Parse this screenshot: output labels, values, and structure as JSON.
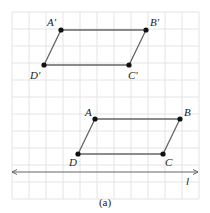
{
  "figure": {
    "caption": "(a)",
    "grid": {
      "x0": 12,
      "y0": 12,
      "cell": 17,
      "cols": 11,
      "rows": 11,
      "color": "#e4e4e4"
    },
    "line_color": "#666666",
    "point_color": "#111111",
    "line_l": {
      "label": "l",
      "y": 172,
      "x1": 12,
      "x2": 198
    },
    "parallelogram_image": {
      "points": [
        {
          "name": "A'",
          "x": 61,
          "y": 30,
          "lx": 47,
          "ly": 26
        },
        {
          "name": "B'",
          "x": 146,
          "y": 30,
          "lx": 150,
          "ly": 26
        },
        {
          "name": "C'",
          "x": 129,
          "y": 65,
          "lx": 128,
          "ly": 79
        },
        {
          "name": "D'",
          "x": 44,
          "y": 65,
          "lx": 30,
          "ly": 79
        }
      ]
    },
    "parallelogram_original": {
      "points": [
        {
          "name": "A",
          "x": 95,
          "y": 119,
          "lx": 85,
          "ly": 116
        },
        {
          "name": "B",
          "x": 180,
          "y": 119,
          "lx": 184,
          "ly": 116
        },
        {
          "name": "C",
          "x": 163,
          "y": 154,
          "lx": 165,
          "ly": 166
        },
        {
          "name": "D",
          "x": 78,
          "y": 154,
          "lx": 69,
          "ly": 166
        }
      ]
    }
  }
}
